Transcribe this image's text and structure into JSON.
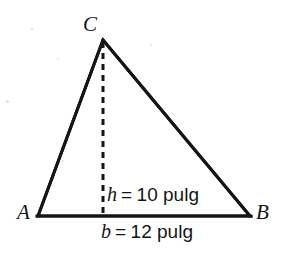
{
  "figure": {
    "kind": "geometry-diagram",
    "shape": "triangle",
    "background_color": "#ffffff",
    "ink_color": "#151515",
    "vertices": [
      {
        "id": "c",
        "label": "C",
        "x": 103,
        "y": 40
      },
      {
        "id": "a",
        "label": "A",
        "x": 38,
        "y": 216
      },
      {
        "id": "b",
        "label": "B",
        "x": 250,
        "y": 216
      }
    ],
    "edges": [
      {
        "id": "ac",
        "from": "a",
        "to": "c",
        "style": "solid",
        "width": 3
      },
      {
        "id": "cb",
        "from": "c",
        "to": "b",
        "style": "solid",
        "width": 3
      },
      {
        "id": "ab",
        "from": "a",
        "to": "b",
        "style": "solid",
        "width": 3
      }
    ],
    "altitude": {
      "id": "height-line",
      "from_x": 103,
      "from_y": 40,
      "to_x": 103,
      "to_y": 216,
      "style": "dashed",
      "width": 3,
      "dash": "6 5"
    },
    "measures": {
      "height": {
        "symbol": "h",
        "equals": "=",
        "value": "10",
        "unit": "pulg",
        "text": "h = 10 pulg"
      },
      "base": {
        "symbol": "b",
        "equals": "=",
        "value": "12",
        "unit": "pulg",
        "text": "b = 12 pulg"
      }
    },
    "scan_specks": [
      {
        "x": 6,
        "y": 100,
        "d": 3
      },
      {
        "x": 31,
        "y": 28,
        "d": 2
      },
      {
        "x": 57,
        "y": 58,
        "d": 2
      },
      {
        "x": 150,
        "y": 44,
        "d": 2
      },
      {
        "x": 62,
        "y": 160,
        "d": 2
      }
    ]
  }
}
